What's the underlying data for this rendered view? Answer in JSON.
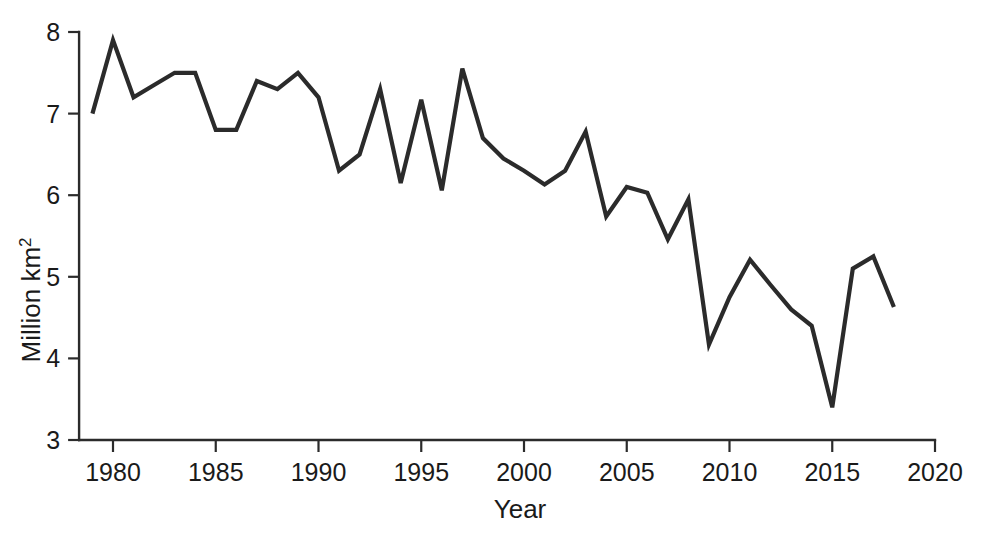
{
  "chart_data": {
    "type": "line",
    "title": "",
    "xlabel": "Year",
    "ylabel": "Million  km²",
    "ylabel_base": "Million  km",
    "ylabel_superscript": "2",
    "xlim": [
      1978.4,
      2020
    ],
    "ylim": [
      3,
      8
    ],
    "grid": false,
    "legend": null,
    "line_color": "#2b2b2b",
    "x": [
      1979,
      1980,
      1981,
      1982,
      1983,
      1984,
      1985,
      1986,
      1987,
      1988,
      1989,
      1990,
      1991,
      1992,
      1993,
      1994,
      1995,
      1996,
      1997,
      1998,
      1999,
      2000,
      2001,
      2002,
      2003,
      2004,
      2005,
      2006,
      2007,
      2008,
      2009,
      2010,
      2011,
      2012,
      2013,
      2014,
      2015,
      2016,
      2017,
      2018
    ],
    "values": [
      7.0,
      7.9,
      7.2,
      7.35,
      7.5,
      7.5,
      6.8,
      6.8,
      7.4,
      7.3,
      7.5,
      7.2,
      6.3,
      6.5,
      7.3,
      6.15,
      7.17,
      6.06,
      7.55,
      6.7,
      6.45,
      6.3,
      6.13,
      6.3,
      6.78,
      5.74,
      6.1,
      6.03,
      5.46,
      5.95,
      4.17,
      4.75,
      5.21,
      4.9,
      4.6,
      4.4,
      3.4,
      5.1,
      5.25,
      4.63
    ],
    "series": [
      {
        "name": "Arctic sea ice extent",
        "values": [
          7.0,
          7.9,
          7.2,
          7.35,
          7.5,
          7.5,
          6.8,
          6.8,
          7.4,
          7.3,
          7.5,
          7.2,
          6.3,
          6.5,
          7.3,
          6.15,
          7.17,
          6.06,
          7.55,
          6.7,
          6.45,
          6.3,
          6.13,
          6.3,
          6.78,
          5.74,
          6.1,
          6.03,
          5.46,
          5.95,
          4.17,
          4.75,
          5.21,
          4.9,
          4.6,
          4.4,
          3.4,
          5.1,
          5.25,
          4.63
        ]
      }
    ],
    "points": [
      {
        "x": 1979,
        "y": 7.0
      },
      {
        "x": 1980,
        "y": 7.9
      },
      {
        "x": 1981,
        "y": 7.2
      },
      {
        "x": 1982,
        "y": 7.35
      },
      {
        "x": 1983,
        "y": 7.5
      },
      {
        "x": 1984,
        "y": 7.5
      },
      {
        "x": 1985,
        "y": 6.8
      },
      {
        "x": 1986,
        "y": 6.8
      },
      {
        "x": 1987,
        "y": 7.4
      },
      {
        "x": 1988,
        "y": 7.3
      },
      {
        "x": 1989,
        "y": 7.5
      },
      {
        "x": 1990,
        "y": 7.2
      },
      {
        "x": 1991,
        "y": 6.3
      },
      {
        "x": 1992,
        "y": 6.5
      },
      {
        "x": 1993,
        "y": 7.3
      },
      {
        "x": 1994,
        "y": 6.15
      },
      {
        "x": 1995,
        "y": 7.17
      },
      {
        "x": 1996,
        "y": 6.06
      },
      {
        "x": 1997,
        "y": 7.55
      },
      {
        "x": 1998,
        "y": 6.7
      },
      {
        "x": 1999,
        "y": 6.45
      },
      {
        "x": 2000,
        "y": 6.3
      },
      {
        "x": 2001,
        "y": 6.13
      },
      {
        "x": 2002,
        "y": 6.3
      },
      {
        "x": 2003,
        "y": 6.78
      },
      {
        "x": 2004,
        "y": 5.74
      },
      {
        "x": 2005,
        "y": 6.1
      },
      {
        "x": 2006,
        "y": 6.03
      },
      {
        "x": 2007,
        "y": 5.46
      },
      {
        "x": 2008,
        "y": 5.95
      },
      {
        "x": 2009,
        "y": 4.17
      },
      {
        "x": 2010,
        "y": 4.75
      },
      {
        "x": 2011,
        "y": 5.21
      },
      {
        "x": 2012,
        "y": 4.9
      },
      {
        "x": 2013,
        "y": 4.6
      },
      {
        "x": 2014,
        "y": 4.4
      },
      {
        "x": 2015,
        "y": 3.4
      },
      {
        "x": 2016,
        "y": 5.1
      },
      {
        "x": 2017,
        "y": 5.25
      },
      {
        "x": 2018,
        "y": 4.63
      }
    ],
    "xticks": [
      1980,
      1985,
      1990,
      1995,
      2000,
      2005,
      2010,
      2015,
      2020
    ],
    "xtick_labels": [
      "1980",
      "1985",
      "1990",
      "1995",
      "2000",
      "2005",
      "2010",
      "2015",
      "2020"
    ],
    "yticks": [
      3,
      4,
      5,
      6,
      7,
      8
    ],
    "ytick_labels": [
      "3",
      "4",
      "5",
      "6",
      "7",
      "8"
    ]
  }
}
